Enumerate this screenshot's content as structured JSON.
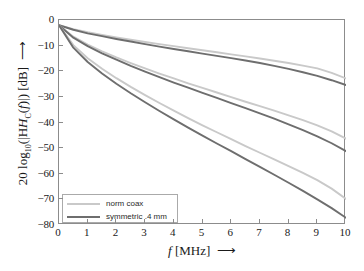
{
  "chart_data": {
    "type": "line",
    "title": "",
    "xlabel": "f [MHz]",
    "ylabel": "20 log10(|H_C(f)|) [dB]",
    "xlim": [
      0,
      10
    ],
    "ylim": [
      -80,
      0
    ],
    "xticks": [
      0,
      1,
      2,
      3,
      4,
      5,
      6,
      7,
      8,
      9,
      10
    ],
    "xtick_labels": [
      "0",
      "1",
      "2",
      "3",
      "4",
      "5",
      "6",
      "7",
      "8",
      "9",
      "10"
    ],
    "yticks": [
      0,
      -10,
      -20,
      -30,
      -40,
      -50,
      -60,
      -70,
      -80
    ],
    "ytick_labels": [
      "0",
      "−10",
      "−20",
      "−30",
      "−40",
      "−50",
      "−60",
      "−70",
      "−80"
    ],
    "grid": false,
    "legend_position": "lower left",
    "x": [
      0,
      0.5,
      1,
      1.5,
      2,
      2.5,
      3,
      3.5,
      4,
      4.5,
      5,
      5.5,
      6,
      6.5,
      7,
      7.5,
      8,
      8.5,
      9,
      9.5,
      10
    ],
    "series": [
      {
        "name": "norm coax",
        "group": "cable-1",
        "color": "#c9c9c9",
        "values": [
          -2.0,
          -3.6,
          -4.8,
          -5.8,
          -6.8,
          -7.7,
          -8.6,
          -9.4,
          -10.2,
          -11.0,
          -11.8,
          -12.6,
          -13.4,
          -14.2,
          -15.0,
          -15.9,
          -16.8,
          -17.8,
          -18.9,
          -20.6,
          -22.8
        ]
      },
      {
        "name": "symmetric .4 mm",
        "group": "cable-1",
        "color": "#6e6e6e",
        "values": [
          -2.0,
          -3.8,
          -5.2,
          -6.3,
          -7.4,
          -8.4,
          -9.4,
          -10.4,
          -11.3,
          -12.2,
          -13.1,
          -14.0,
          -14.9,
          -15.8,
          -16.8,
          -17.9,
          -19.1,
          -20.4,
          -21.8,
          -23.5,
          -25.4
        ]
      },
      {
        "name": "norm coax",
        "group": "cable-2",
        "color": "#c9c9c9",
        "values": [
          -2.0,
          -6.5,
          -9.6,
          -12.2,
          -14.6,
          -16.8,
          -18.9,
          -20.9,
          -22.8,
          -24.7,
          -26.5,
          -28.3,
          -30.1,
          -31.9,
          -33.6,
          -35.4,
          -37.2,
          -39.1,
          -41.1,
          -43.5,
          -46.3
        ]
      },
      {
        "name": "symmetric .4 mm",
        "group": "cable-2",
        "color": "#6e6e6e",
        "values": [
          -2.0,
          -6.9,
          -10.2,
          -13.0,
          -15.5,
          -17.9,
          -20.1,
          -22.3,
          -24.4,
          -26.4,
          -28.4,
          -30.4,
          -32.4,
          -34.4,
          -36.4,
          -38.5,
          -40.7,
          -43.0,
          -45.4,
          -48.1,
          -51.2
        ]
      },
      {
        "name": "norm coax",
        "group": "cable-3",
        "color": "#c9c9c9",
        "values": [
          -2.0,
          -9.8,
          -14.9,
          -19.0,
          -22.7,
          -26.1,
          -29.3,
          -32.4,
          -35.4,
          -38.3,
          -41.1,
          -43.8,
          -46.5,
          -49.2,
          -51.8,
          -54.4,
          -57.0,
          -59.7,
          -62.5,
          -65.8,
          -69.8
        ]
      },
      {
        "name": "symmetric .4 mm",
        "group": "cable-3",
        "color": "#6e6e6e",
        "values": [
          -2.0,
          -10.8,
          -16.4,
          -20.9,
          -24.9,
          -28.6,
          -32.1,
          -35.5,
          -38.8,
          -42.0,
          -45.1,
          -48.2,
          -51.2,
          -54.3,
          -57.3,
          -60.4,
          -63.5,
          -66.7,
          -70.0,
          -73.4,
          -77.2
        ]
      }
    ]
  },
  "legend": {
    "entries": [
      {
        "label": "norm coax",
        "color": "#c9c9c9"
      },
      {
        "label": "symmetric .4 mm",
        "color": "#6e6e6e"
      }
    ]
  },
  "axes": {
    "y_title_prefix": "20 log",
    "y_title_sub": "10",
    "y_title_mid": "(|H",
    "y_title_sub2": "C",
    "y_title_f": "f",
    "y_title_tail": ")|) [dB]",
    "y_title_arrow": "⟶",
    "x_title_f": "f",
    "x_title_unit": "[MHz]",
    "x_title_arrow": "⟶"
  },
  "colors": {
    "axis": "#8c8c8c",
    "text": "#1a1a1a",
    "background": "#ffffff",
    "light_series": "#c9c9c9",
    "dark_series": "#6e6e6e"
  }
}
